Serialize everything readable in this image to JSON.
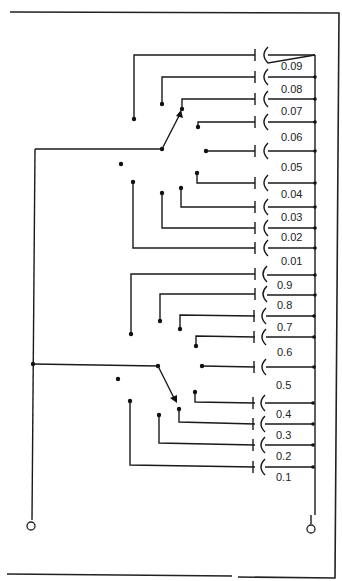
{
  "diagram": {
    "type": "decade capacitor switch schematic",
    "colors": {
      "line": "#1a1a1a",
      "background": "#ffffff"
    },
    "upper_decade": {
      "labels": [
        "0.09",
        "0.08",
        "0.07",
        "0.06",
        "0.05",
        "0.04",
        "0.03",
        "0.02",
        "0.01"
      ]
    },
    "lower_decade": {
      "labels": [
        "0.9",
        "0.8",
        "0.7",
        "0.6",
        "0.5",
        "0.4",
        "0.3",
        "0.2",
        "0.1"
      ]
    },
    "terminals": [
      "left-terminal",
      "right-terminal"
    ]
  }
}
